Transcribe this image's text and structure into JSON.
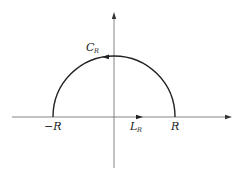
{
  "diagram": {
    "colors": {
      "axis": "#555555",
      "contour": "#222222",
      "background": "#ffffff"
    },
    "axes": {
      "horizontal": {
        "x1": 12,
        "x2": 232,
        "y": 117
      },
      "vertical": {
        "x": 114,
        "y1": 168,
        "y2": 12
      }
    },
    "contour": {
      "center_x": 114,
      "center_y": 117,
      "radius": 61
    },
    "labels": {
      "minus_r": "−R",
      "r": "R",
      "l_main": "L",
      "l_sub": "R",
      "c_main": "C",
      "c_sub": "R"
    }
  }
}
